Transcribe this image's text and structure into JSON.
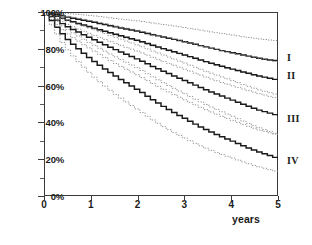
{
  "chart_data": {
    "type": "line",
    "title": "",
    "subtitle": "",
    "xlabel": "years",
    "ylabel": "",
    "xlim": [
      0,
      5
    ],
    "ylim": [
      0,
      1
    ],
    "grid": false,
    "legend_position": "right-of-axes",
    "x_ticks": [
      {
        "value": 0,
        "label": "0"
      },
      {
        "value": 1,
        "label": "1"
      },
      {
        "value": 2,
        "label": "2"
      },
      {
        "value": 3,
        "label": "3"
      },
      {
        "value": 4,
        "label": "4"
      },
      {
        "value": 5,
        "label": "5"
      }
    ],
    "y_ticks": [
      {
        "value": 1.0,
        "label": "100%"
      },
      {
        "value": 0.8,
        "label": "80%"
      },
      {
        "value": 0.6,
        "label": "60%"
      },
      {
        "value": 0.4,
        "label": "40%"
      },
      {
        "value": 0.2,
        "label": "20%"
      },
      {
        "value": 0.0,
        "label": "0%"
      }
    ],
    "y_minor_ticks": [
      0.9,
      0.7,
      0.5,
      0.3,
      0.1
    ],
    "annotations": [
      {
        "text": "I",
        "x": 5.0,
        "y": 0.755
      },
      {
        "text": "II",
        "x": 5.0,
        "y": 0.655
      },
      {
        "text": "III",
        "x": 5.0,
        "y": 0.425
      },
      {
        "text": "IV",
        "x": 5.0,
        "y": 0.195
      }
    ],
    "series": [
      {
        "name": "I",
        "style": "solid",
        "role": "estimate",
        "color": "#1a1a1a",
        "x": [
          0,
          0.1,
          0.25,
          0.4,
          0.6,
          0.8,
          1.0,
          1.25,
          1.5,
          1.75,
          2.0,
          2.25,
          2.5,
          2.75,
          3.0,
          3.25,
          3.5,
          3.75,
          4.0,
          4.25,
          4.5,
          4.75,
          5.0
        ],
        "values": [
          1.0,
          0.995,
          0.985,
          0.975,
          0.965,
          0.955,
          0.945,
          0.932,
          0.918,
          0.905,
          0.893,
          0.878,
          0.864,
          0.85,
          0.836,
          0.82,
          0.805,
          0.79,
          0.778,
          0.764,
          0.75,
          0.74,
          0.733
        ]
      },
      {
        "name": "I upper CI",
        "style": "dotted",
        "role": "upper-ci",
        "color": "#7a7a7a",
        "x": [
          0,
          0.1,
          0.25,
          0.4,
          0.6,
          0.8,
          1.0,
          1.25,
          1.5,
          1.75,
          2.0,
          2.25,
          2.5,
          2.75,
          3.0,
          3.25,
          3.5,
          3.75,
          4.0,
          4.25,
          4.5,
          4.75,
          5.0
        ],
        "values": [
          1.0,
          1.0,
          0.997,
          0.993,
          0.989,
          0.984,
          0.979,
          0.972,
          0.964,
          0.957,
          0.95,
          0.941,
          0.932,
          0.923,
          0.914,
          0.903,
          0.893,
          0.883,
          0.874,
          0.864,
          0.855,
          0.848,
          0.843
        ]
      },
      {
        "name": "I lower CI",
        "style": "dotted",
        "role": "lower-ci",
        "color": "#7a7a7a",
        "x": [
          0,
          0.1,
          0.25,
          0.4,
          0.6,
          0.8,
          1.0,
          1.25,
          1.5,
          1.75,
          2.0,
          2.25,
          2.5,
          2.75,
          3.0,
          3.25,
          3.5,
          3.75,
          4.0,
          4.25,
          4.5,
          4.75,
          5.0
        ],
        "values": [
          1.0,
          0.988,
          0.972,
          0.956,
          0.94,
          0.925,
          0.911,
          0.892,
          0.873,
          0.855,
          0.838,
          0.817,
          0.797,
          0.779,
          0.76,
          0.74,
          0.721,
          0.702,
          0.686,
          0.669,
          0.652,
          0.639,
          0.628
        ]
      },
      {
        "name": "II",
        "style": "solid",
        "role": "estimate",
        "color": "#1a1a1a",
        "x": [
          0,
          0.1,
          0.25,
          0.4,
          0.6,
          0.8,
          1.0,
          1.25,
          1.5,
          1.75,
          2.0,
          2.25,
          2.5,
          2.75,
          3.0,
          3.25,
          3.5,
          3.75,
          4.0,
          4.25,
          4.5,
          4.75,
          5.0
        ],
        "values": [
          1.0,
          0.99,
          0.975,
          0.96,
          0.944,
          0.929,
          0.914,
          0.895,
          0.877,
          0.859,
          0.842,
          0.821,
          0.801,
          0.782,
          0.763,
          0.743,
          0.723,
          0.705,
          0.688,
          0.671,
          0.655,
          0.641,
          0.628
        ]
      },
      {
        "name": "II upper CI",
        "style": "dotted",
        "role": "upper-ci",
        "color": "#7a7a7a",
        "x": [
          0,
          0.1,
          0.25,
          0.4,
          0.6,
          0.8,
          1.0,
          1.25,
          1.5,
          1.75,
          2.0,
          2.25,
          2.5,
          2.75,
          3.0,
          3.25,
          3.5,
          3.75,
          4.0,
          4.25,
          4.5,
          4.75,
          5.0
        ],
        "values": [
          1.0,
          0.997,
          0.989,
          0.98,
          0.97,
          0.96,
          0.95,
          0.936,
          0.923,
          0.91,
          0.897,
          0.881,
          0.866,
          0.851,
          0.836,
          0.82,
          0.804,
          0.79,
          0.776,
          0.762,
          0.749,
          0.738,
          0.728
        ]
      },
      {
        "name": "II lower CI",
        "style": "dotted",
        "role": "lower-ci",
        "color": "#7a7a7a",
        "x": [
          0,
          0.1,
          0.25,
          0.4,
          0.6,
          0.8,
          1.0,
          1.25,
          1.5,
          1.75,
          2.0,
          2.25,
          2.5,
          2.75,
          3.0,
          3.25,
          3.5,
          3.75,
          4.0,
          4.25,
          4.5,
          4.75,
          5.0
        ],
        "values": [
          1.0,
          0.982,
          0.96,
          0.938,
          0.916,
          0.895,
          0.875,
          0.851,
          0.827,
          0.804,
          0.782,
          0.756,
          0.731,
          0.708,
          0.685,
          0.661,
          0.638,
          0.617,
          0.597,
          0.578,
          0.559,
          0.543,
          0.528
        ]
      },
      {
        "name": "III",
        "style": "solid",
        "role": "estimate",
        "color": "#1a1a1a",
        "x": [
          0,
          0.1,
          0.25,
          0.4,
          0.6,
          0.8,
          1.0,
          1.25,
          1.5,
          1.75,
          2.0,
          2.25,
          2.5,
          2.75,
          3.0,
          3.25,
          3.5,
          3.75,
          4.0,
          4.25,
          4.5,
          4.75,
          5.0
        ],
        "values": [
          1.0,
          0.978,
          0.952,
          0.927,
          0.901,
          0.876,
          0.852,
          0.822,
          0.793,
          0.765,
          0.738,
          0.707,
          0.678,
          0.65,
          0.623,
          0.595,
          0.568,
          0.543,
          0.519,
          0.494,
          0.47,
          0.452,
          0.434
        ]
      },
      {
        "name": "III upper CI",
        "style": "dotted",
        "role": "upper-ci",
        "color": "#7a7a7a",
        "x": [
          0,
          0.1,
          0.25,
          0.4,
          0.6,
          0.8,
          1.0,
          1.25,
          1.5,
          1.75,
          2.0,
          2.25,
          2.5,
          2.75,
          3.0,
          3.25,
          3.5,
          3.75,
          4.0,
          4.25,
          4.5,
          4.75,
          5.0
        ],
        "values": [
          1.0,
          0.99,
          0.974,
          0.958,
          0.941,
          0.923,
          0.906,
          0.883,
          0.86,
          0.838,
          0.816,
          0.79,
          0.766,
          0.742,
          0.718,
          0.693,
          0.669,
          0.647,
          0.625,
          0.602,
          0.58,
          0.563,
          0.546
        ]
      },
      {
        "name": "III lower CI",
        "style": "dotted",
        "role": "lower-ci",
        "color": "#7a7a7a",
        "x": [
          0,
          0.1,
          0.25,
          0.4,
          0.6,
          0.8,
          1.0,
          1.25,
          1.5,
          1.75,
          2.0,
          2.25,
          2.5,
          2.75,
          3.0,
          3.25,
          3.5,
          3.75,
          4.0,
          4.25,
          4.5,
          4.75,
          5.0
        ],
        "values": [
          1.0,
          0.963,
          0.926,
          0.89,
          0.855,
          0.822,
          0.791,
          0.753,
          0.717,
          0.683,
          0.65,
          0.614,
          0.58,
          0.548,
          0.517,
          0.487,
          0.459,
          0.433,
          0.409,
          0.385,
          0.362,
          0.345,
          0.329
        ]
      },
      {
        "name": "IV",
        "style": "solid",
        "role": "estimate",
        "color": "#1a1a1a",
        "x": [
          0,
          0.1,
          0.25,
          0.4,
          0.6,
          0.8,
          1.0,
          1.25,
          1.5,
          1.75,
          2.0,
          2.25,
          2.5,
          2.75,
          3.0,
          3.25,
          3.5,
          3.75,
          4.0,
          4.25,
          4.5,
          4.75,
          5.0
        ],
        "values": [
          1.0,
          0.958,
          0.91,
          0.863,
          0.818,
          0.775,
          0.735,
          0.69,
          0.648,
          0.608,
          0.57,
          0.527,
          0.487,
          0.45,
          0.416,
          0.381,
          0.35,
          0.322,
          0.296,
          0.268,
          0.243,
          0.222,
          0.2
        ]
      },
      {
        "name": "IV upper CI",
        "style": "dotted",
        "role": "upper-ci",
        "color": "#7a7a7a",
        "x": [
          0,
          0.1,
          0.25,
          0.4,
          0.6,
          0.8,
          1.0,
          1.25,
          1.5,
          1.75,
          2.0,
          2.25,
          2.5,
          2.75,
          3.0,
          3.25,
          3.5,
          3.75,
          4.0,
          4.25,
          4.5,
          4.75,
          5.0
        ],
        "values": [
          1.0,
          0.976,
          0.944,
          0.913,
          0.882,
          0.851,
          0.822,
          0.787,
          0.753,
          0.721,
          0.689,
          0.651,
          0.616,
          0.582,
          0.55,
          0.517,
          0.486,
          0.458,
          0.431,
          0.402,
          0.375,
          0.353,
          0.33
        ]
      },
      {
        "name": "IV lower CI",
        "style": "dotted",
        "role": "lower-ci",
        "color": "#7a7a7a",
        "x": [
          0,
          0.1,
          0.25,
          0.4,
          0.6,
          0.8,
          1.0,
          1.25,
          1.5,
          1.75,
          2.0,
          2.25,
          2.5,
          2.75,
          3.0,
          3.25,
          3.5,
          3.75,
          4.0,
          4.25,
          4.5,
          4.75,
          5.0
        ],
        "values": [
          1.0,
          0.936,
          0.871,
          0.81,
          0.752,
          0.699,
          0.65,
          0.597,
          0.548,
          0.503,
          0.462,
          0.417,
          0.377,
          0.341,
          0.309,
          0.278,
          0.25,
          0.226,
          0.204,
          0.181,
          0.161,
          0.145,
          0.128
        ]
      }
    ]
  }
}
